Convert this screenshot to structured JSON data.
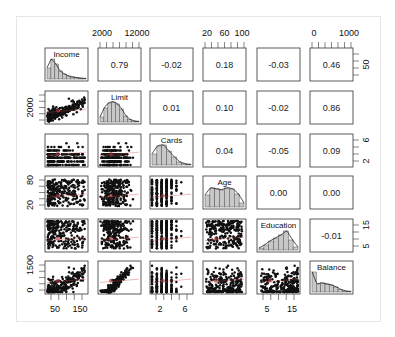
{
  "chart_data": {
    "type": "scatter",
    "subtype": "pairs-matrix",
    "variables": [
      "Income",
      "Limit",
      "Cards",
      "Age",
      "Education",
      "Balance"
    ],
    "upper_panel": "correlation",
    "diagonal_panel": "histogram with density line",
    "lower_panel": "scatter with loess smoother",
    "correlations": [
      [
        "",
        "0.79",
        "-0.02",
        "0.18",
        "-0.03",
        "0.46"
      ],
      [
        "",
        "",
        "0.01",
        "0.10",
        "-0.02",
        "0.86"
      ],
      [
        "",
        "",
        "",
        "0.04",
        "-0.05",
        "0.09"
      ],
      [
        "",
        "",
        "",
        "",
        "0.00",
        "0.00"
      ],
      [
        "",
        "",
        "",
        "",
        "",
        "-0.01"
      ],
      [
        "",
        "",
        "",
        "",
        "",
        ""
      ]
    ],
    "axes": {
      "top": [
        {
          "col": 1,
          "ticks": [
            "2000",
            "12000"
          ]
        },
        {
          "col": 3,
          "ticks": [
            "20",
            "60",
            "100"
          ]
        },
        {
          "col": 5,
          "ticks": [
            "0",
            "1000"
          ]
        }
      ],
      "bottom": [
        {
          "col": 0,
          "ticks": [
            "50",
            "150"
          ]
        },
        {
          "col": 2,
          "ticks": [
            "2",
            "6"
          ]
        },
        {
          "col": 4,
          "ticks": [
            "5",
            "15"
          ]
        }
      ],
      "left": [
        {
          "row": 1,
          "ticks": [
            "2000"
          ]
        },
        {
          "row": 3,
          "ticks": [
            "20",
            "80"
          ]
        },
        {
          "row": 5,
          "ticks": [
            "0",
            "1500"
          ]
        }
      ],
      "right": [
        {
          "row": 0,
          "ticks": [
            "50"
          ]
        },
        {
          "row": 2,
          "ticks": [
            "2",
            "6"
          ]
        },
        {
          "row": 4,
          "ticks": [
            "5",
            "15"
          ]
        }
      ]
    },
    "ranges": {
      "Income": [
        10,
        190
      ],
      "Limit": [
        850,
        13900
      ],
      "Cards": [
        1,
        9
      ],
      "Age": [
        23,
        98
      ],
      "Education": [
        5,
        20
      ],
      "Balance": [
        0,
        2000
      ]
    },
    "histogram_shapes": {
      "Income": [
        0.55,
        1.0,
        0.75,
        0.4,
        0.25,
        0.15,
        0.1,
        0.07,
        0.04,
        0.03
      ],
      "Limit": [
        0.25,
        0.7,
        0.95,
        1.0,
        0.9,
        0.65,
        0.3,
        0.12,
        0.05,
        0.03
      ],
      "Cards": [
        0.55,
        0.95,
        1.0,
        0.7,
        0.4,
        0.15,
        0.06,
        0.03
      ],
      "Age": [
        0.6,
        0.95,
        0.9,
        0.85,
        0.95,
        0.9,
        0.65,
        0.2
      ],
      "Education": [
        0.1,
        0.25,
        0.45,
        0.6,
        0.75,
        0.95,
        0.5,
        0.15
      ],
      "Balance": [
        1.0,
        0.4,
        0.45,
        0.4,
        0.35,
        0.25,
        0.12,
        0.05,
        0.03
      ]
    },
    "title": "",
    "grid": false,
    "legend": "none"
  },
  "caption": " "
}
